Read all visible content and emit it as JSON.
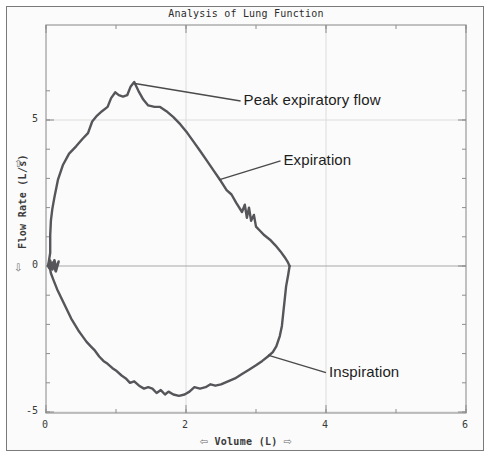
{
  "chart_data": {
    "type": "line",
    "title": "Analysis of Lung Function",
    "xlabel": "Volume (L)",
    "ylabel": "Flow Rate (L/s)",
    "xlim": [
      0,
      6
    ],
    "ylim": [
      -5,
      6.6
    ],
    "xticks": [
      "0",
      "2",
      "4",
      "6"
    ],
    "xtick_values": [
      0,
      2,
      4,
      6
    ],
    "yticks": [
      "5",
      "0",
      "-5"
    ],
    "ytick_values": [
      5,
      0,
      -5
    ],
    "x_minor_step": 1,
    "y_minor_step": 1,
    "grid": true,
    "legend": "none",
    "line_color": "#55555a",
    "grid_color": "#dcdcdc",
    "axis_color": "#9a9a9a",
    "annotations": [
      {
        "label": "Peak expiratory flow",
        "text_x": 2.78,
        "text_y": 5.65,
        "point_x": 1.27,
        "point_y": 6.25
      },
      {
        "label": "Expiration",
        "text_x": 3.35,
        "text_y": 3.6,
        "point_x": 2.47,
        "point_y": 2.95
      },
      {
        "label": "Inspiration",
        "text_x": 4.0,
        "text_y": -3.65,
        "point_x": 3.17,
        "point_y": -3.05
      }
    ],
    "series": [
      {
        "name": "Expiration",
        "phase": "expiratory",
        "points": [
          [
            0.03,
            0.0
          ],
          [
            0.06,
            0.45
          ],
          [
            0.06,
            1.05
          ],
          [
            0.07,
            1.55
          ],
          [
            0.09,
            1.95
          ],
          [
            0.12,
            2.35
          ],
          [
            0.17,
            2.95
          ],
          [
            0.24,
            3.45
          ],
          [
            0.33,
            3.85
          ],
          [
            0.43,
            4.1
          ],
          [
            0.52,
            4.35
          ],
          [
            0.6,
            4.55
          ],
          [
            0.66,
            4.95
          ],
          [
            0.73,
            5.15
          ],
          [
            0.8,
            5.3
          ],
          [
            0.88,
            5.45
          ],
          [
            0.93,
            5.75
          ],
          [
            0.99,
            5.95
          ],
          [
            1.04,
            5.85
          ],
          [
            1.1,
            5.8
          ],
          [
            1.16,
            5.85
          ],
          [
            1.21,
            6.15
          ],
          [
            1.26,
            6.3
          ],
          [
            1.32,
            6.0
          ],
          [
            1.39,
            5.7
          ],
          [
            1.46,
            5.5
          ],
          [
            1.55,
            5.45
          ],
          [
            1.63,
            5.45
          ],
          [
            1.72,
            5.3
          ],
          [
            1.82,
            5.1
          ],
          [
            1.92,
            4.85
          ],
          [
            2.02,
            4.55
          ],
          [
            2.11,
            4.25
          ],
          [
            2.2,
            3.95
          ],
          [
            2.3,
            3.6
          ],
          [
            2.4,
            3.25
          ],
          [
            2.5,
            2.9
          ],
          [
            2.58,
            2.6
          ],
          [
            2.65,
            2.45
          ],
          [
            2.72,
            2.15
          ],
          [
            2.8,
            1.85
          ],
          [
            2.84,
            2.1
          ],
          [
            2.87,
            1.65
          ],
          [
            2.9,
            2.0
          ],
          [
            2.93,
            1.55
          ],
          [
            2.97,
            1.75
          ],
          [
            3.0,
            1.35
          ],
          [
            3.06,
            1.2
          ],
          [
            3.12,
            1.05
          ],
          [
            3.2,
            0.9
          ],
          [
            3.28,
            0.7
          ],
          [
            3.35,
            0.5
          ],
          [
            3.41,
            0.3
          ],
          [
            3.45,
            0.15
          ],
          [
            3.48,
            0.0
          ]
        ]
      },
      {
        "name": "Inspiration",
        "phase": "inspiratory",
        "points": [
          [
            3.48,
            0.0
          ],
          [
            3.46,
            -0.3
          ],
          [
            3.43,
            -0.7
          ],
          [
            3.41,
            -1.15
          ],
          [
            3.39,
            -1.6
          ],
          [
            3.37,
            -2.05
          ],
          [
            3.34,
            -2.4
          ],
          [
            3.29,
            -2.75
          ],
          [
            3.24,
            -2.95
          ],
          [
            3.17,
            -3.1
          ],
          [
            3.09,
            -3.25
          ],
          [
            3.0,
            -3.4
          ],
          [
            2.9,
            -3.55
          ],
          [
            2.8,
            -3.7
          ],
          [
            2.7,
            -3.85
          ],
          [
            2.6,
            -3.95
          ],
          [
            2.5,
            -4.05
          ],
          [
            2.42,
            -4.1
          ],
          [
            2.35,
            -4.05
          ],
          [
            2.28,
            -4.15
          ],
          [
            2.2,
            -4.2
          ],
          [
            2.12,
            -4.15
          ],
          [
            2.05,
            -4.3
          ],
          [
            1.98,
            -4.4
          ],
          [
            1.9,
            -4.45
          ],
          [
            1.82,
            -4.4
          ],
          [
            1.75,
            -4.3
          ],
          [
            1.7,
            -4.4
          ],
          [
            1.64,
            -4.25
          ],
          [
            1.58,
            -4.35
          ],
          [
            1.52,
            -4.2
          ],
          [
            1.46,
            -4.15
          ],
          [
            1.4,
            -4.2
          ],
          [
            1.33,
            -4.1
          ],
          [
            1.26,
            -3.95
          ],
          [
            1.2,
            -4.0
          ],
          [
            1.14,
            -3.85
          ],
          [
            1.08,
            -3.75
          ],
          [
            1.01,
            -3.6
          ],
          [
            0.95,
            -3.5
          ],
          [
            0.88,
            -3.35
          ],
          [
            0.82,
            -3.25
          ],
          [
            0.76,
            -3.1
          ],
          [
            0.7,
            -2.9
          ],
          [
            0.64,
            -2.75
          ],
          [
            0.58,
            -2.6
          ],
          [
            0.52,
            -2.4
          ],
          [
            0.46,
            -2.2
          ],
          [
            0.41,
            -2.0
          ],
          [
            0.36,
            -1.8
          ],
          [
            0.31,
            -1.55
          ],
          [
            0.26,
            -1.3
          ],
          [
            0.21,
            -1.05
          ],
          [
            0.16,
            -0.8
          ],
          [
            0.11,
            -0.5
          ],
          [
            0.07,
            -0.25
          ],
          [
            0.05,
            0.0
          ]
        ]
      },
      {
        "name": "Zero-crossing noise",
        "phase": "noise",
        "points": [
          [
            0.03,
            0.0
          ],
          [
            0.06,
            0.18
          ],
          [
            0.09,
            -0.12
          ],
          [
            0.12,
            0.2
          ],
          [
            0.15,
            -0.1
          ],
          [
            0.18,
            0.15
          ],
          [
            0.14,
            -0.18
          ],
          [
            0.1,
            0.12
          ],
          [
            0.05,
            -0.08
          ],
          [
            0.03,
            0.0
          ]
        ]
      }
    ]
  },
  "axis_arrows": {
    "y_up": "⇧",
    "y_down": "⇩",
    "x_left": "⇦",
    "x_right": "⇨"
  }
}
